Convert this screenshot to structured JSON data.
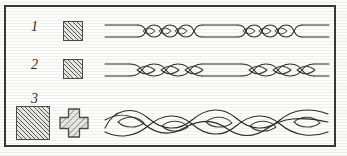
{
  "figure": {
    "background_color": "#fbfbf9",
    "frame_color": "#3a3a3a",
    "ink_color": "#2b2b2b",
    "hatch_color": "#5a5a5a",
    "hatch_fill": "#e9e9e4"
  },
  "rows": [
    {
      "label": "1",
      "marker": "hatched-square-small",
      "marker_size": "small",
      "motif": "tight-twisted-cord-with-straight-intervals",
      "motif_name": "two-strand tight twist"
    },
    {
      "label": "2",
      "marker": "hatched-square-small",
      "marker_size": "small",
      "motif": "loose-twisted-cord-with-straight-intervals",
      "motif_name": "two-strand loose twist"
    },
    {
      "label": "3",
      "marker": "hatched-square-large",
      "marker_size": "large",
      "marker_secondary": "hatched-cross",
      "motif": "continuous-three-strand-braid",
      "motif_name": "three-strand plait"
    }
  ]
}
